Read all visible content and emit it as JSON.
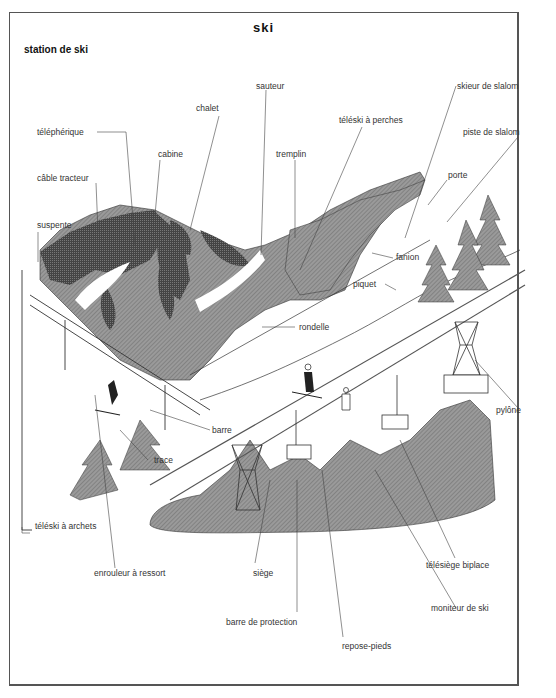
{
  "page": {
    "title": "ski",
    "section": "station de ski"
  },
  "labels": {
    "sauteur": "sauteur",
    "chalet": "chalet",
    "skieur_de_slalom": "skieur de slalom",
    "telepherique": "téléphérique",
    "teleski_a_perches": "téléski à perches",
    "piste_de_slalom": "piste de slalom",
    "cabine": "cabine",
    "tremplin": "tremplin",
    "porte": "porte",
    "cable_tracteur": "câble tracteur",
    "suspente": "suspente",
    "fanion": "fanion",
    "piquet": "piquet",
    "rondelle": "rondelle",
    "pylone": "pylône",
    "barre": "barre",
    "trace": "trace",
    "teleski_a_archets": "téléski à archets",
    "telesiege_biplace": "télésiège biplace",
    "enrouleur_a_ressort": "enrouleur à ressort",
    "siege": "siège",
    "moniteur_de_ski": "moniteur de ski",
    "barre_de_protection": "barre de protection",
    "repose_pieds": "repose-pieds"
  },
  "colors": {
    "border": "#555555",
    "ink": "#333333",
    "tree_fill": "#8a8a8a",
    "dark_fill": "#3a3a3a"
  }
}
